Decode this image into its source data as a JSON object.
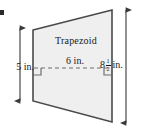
{
  "figure": {
    "shape_label": "Trapezoid",
    "midsegment_label": "6 in.",
    "left_height_label": "5 in.",
    "right_height": {
      "whole": "8",
      "numerator": "1",
      "denominator": "2",
      "unit": "in."
    },
    "colors": {
      "fill": "#efefef",
      "stroke": "#4a4a4a",
      "dashed_line": "#6e6e6e",
      "arrow": "#3a3a3a",
      "text": "#1a1a1a",
      "background": "#ffffff"
    },
    "geometry": {
      "top_left": [
        33,
        30
      ],
      "top_right": [
        112,
        10
      ],
      "bottom_right": [
        112,
        122
      ],
      "bottom_left": [
        33,
        101
      ],
      "midsegment_y": 68,
      "left_arrow_x": 20,
      "left_arrow_top": 26,
      "left_arrow_bottom": 103,
      "right_arrow_x": 126,
      "right_arrow_top": 8,
      "right_arrow_bottom": 125
    }
  }
}
